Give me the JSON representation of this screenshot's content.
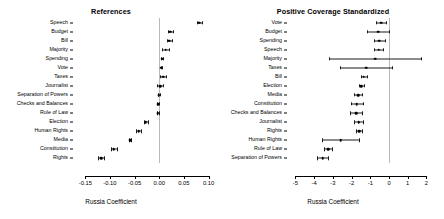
{
  "figure": {
    "width": 444,
    "height": 219,
    "background": "#ffffff",
    "point_color": "#000000",
    "zero_line_color": "#b9b9b9"
  },
  "chart_data": [
    {
      "type": "scatter",
      "panel": "left",
      "title": "References",
      "xlabel": "Russia Coefficient",
      "ylabel": "",
      "orientation": "horizontal",
      "grid": false,
      "legend": null,
      "xlim": [
        -0.175,
        0.105
      ],
      "xticks": [
        -0.15,
        -0.1,
        -0.05,
        0.0,
        0.05,
        0.1
      ],
      "xticklabels": [
        "-0.15",
        "-0.10",
        "-0.05",
        "0.00",
        "0.05",
        "0.10"
      ],
      "reference_line": 0.0,
      "categories": [
        "Speech",
        "Budget",
        "Bill",
        "Majority",
        "Spending",
        "Vote",
        "Taxes",
        "Journalist",
        "Separation of Powers",
        "Checks and Balances",
        "Rule of Law",
        "Election",
        "Human Rights",
        "Media",
        "Constitution",
        "Rights"
      ],
      "estimates": [
        0.0815,
        0.0228,
        0.0205,
        0.0128,
        0.0055,
        0.0042,
        0.0078,
        0.0018,
        -0.0012,
        -0.0022,
        -0.0035,
        -0.0272,
        -0.0415,
        -0.0585,
        -0.0925,
        -0.118
      ],
      "ci_low": [
        0.0765,
        0.0182,
        0.016,
        0.005,
        0.0032,
        0.0026,
        0.0018,
        -0.0042,
        -0.0035,
        -0.0042,
        -0.0055,
        -0.0315,
        -0.0465,
        -0.0605,
        -0.0985,
        -0.1245
      ],
      "ci_high": [
        0.0865,
        0.0272,
        0.025,
        0.0205,
        0.0078,
        0.0058,
        0.0138,
        0.0078,
        0.0012,
        -0.0002,
        -0.0015,
        -0.0228,
        -0.0365,
        -0.0565,
        -0.0865,
        -0.1115
      ]
    },
    {
      "type": "scatter",
      "panel": "right",
      "title": "Positive Coverage Standardized",
      "xlabel": "Russia Coefficient",
      "ylabel": "",
      "orientation": "horizontal",
      "grid": false,
      "legend": null,
      "xlim": [
        -5.45,
        2.35
      ],
      "xticks": [
        -5,
        -4,
        -3,
        -2,
        -1,
        0,
        1,
        2
      ],
      "xticklabels": [
        "-5",
        "-4",
        "-3",
        "-2",
        "-1",
        "0",
        "1",
        "2"
      ],
      "reference_line": 0.0,
      "categories": [
        "Vote",
        "Budget",
        "Spending",
        "Speech",
        "Majority",
        "Taxes",
        "Bill",
        "Election",
        "Media",
        "Constitution",
        "Checks and Balances",
        "Journalist",
        "Rights",
        "Human Rights",
        "Rule of Law",
        "Separation of Powers"
      ],
      "estimates": [
        -0.42,
        -0.58,
        -0.52,
        -0.56,
        -0.75,
        -1.22,
        -1.35,
        -1.48,
        -1.65,
        -1.72,
        -1.75,
        -1.62,
        -1.6,
        -2.58,
        -3.25,
        -3.55
      ],
      "ci_low": [
        -0.7,
        -1.18,
        -0.82,
        -0.8,
        -3.22,
        -2.62,
        -1.52,
        -1.62,
        -1.85,
        -2.05,
        -2.08,
        -1.85,
        -1.75,
        -3.58,
        -3.45,
        -3.85
      ],
      "ci_high": [
        -0.14,
        0.02,
        -0.22,
        -0.32,
        1.72,
        0.18,
        -1.18,
        -1.34,
        -1.45,
        -1.39,
        -1.42,
        -1.39,
        -1.45,
        -1.58,
        -3.05,
        -3.25
      ]
    }
  ]
}
